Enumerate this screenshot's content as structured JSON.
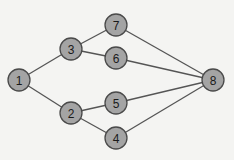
{
  "diagram": {
    "type": "graph",
    "node_radius": 11,
    "colors": {
      "background": "#f4f4f2",
      "node_fill": "#a4a4a4",
      "node_stroke": "#4a4a4a",
      "edge": "#555555",
      "label": "#1a1a1a"
    },
    "nodes": [
      {
        "id": "1",
        "label": "1",
        "x": 19,
        "y": 80
      },
      {
        "id": "2",
        "label": "2",
        "x": 71,
        "y": 113
      },
      {
        "id": "3",
        "label": "3",
        "x": 71,
        "y": 49
      },
      {
        "id": "4",
        "label": "4",
        "x": 116,
        "y": 138
      },
      {
        "id": "5",
        "label": "5",
        "x": 116,
        "y": 103
      },
      {
        "id": "6",
        "label": "6",
        "x": 116,
        "y": 58
      },
      {
        "id": "7",
        "label": "7",
        "x": 116,
        "y": 25
      },
      {
        "id": "8",
        "label": "8",
        "x": 213,
        "y": 80
      }
    ],
    "edges": [
      {
        "from": "1",
        "to": "3"
      },
      {
        "from": "1",
        "to": "2"
      },
      {
        "from": "3",
        "to": "7"
      },
      {
        "from": "3",
        "to": "6"
      },
      {
        "from": "2",
        "to": "5"
      },
      {
        "from": "2",
        "to": "4"
      },
      {
        "from": "7",
        "to": "8"
      },
      {
        "from": "6",
        "to": "8"
      },
      {
        "from": "5",
        "to": "8"
      },
      {
        "from": "4",
        "to": "8"
      }
    ]
  }
}
